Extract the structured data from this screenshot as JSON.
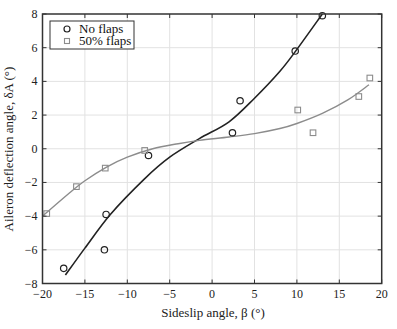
{
  "chart_data": {
    "type": "scatter",
    "title": "",
    "xlabel": "Sideslip angle, β (°)",
    "ylabel": "Aileron deflection angle, δA (°)",
    "xlim": [
      -20,
      20
    ],
    "ylim": [
      -8,
      8
    ],
    "xticks": [
      -20,
      -15,
      -10,
      -5,
      0,
      5,
      10,
      15,
      20
    ],
    "yticks": [
      -8,
      -6,
      -4,
      -2,
      0,
      2,
      4,
      6,
      8
    ],
    "xtick_labels": [
      "−20",
      "−15",
      "−10",
      "−5",
      "0",
      "5",
      "10",
      "15",
      "20"
    ],
    "ytick_labels": [
      "−8",
      "−6",
      "−4",
      "−2",
      "0",
      "2",
      "4",
      "6",
      "8"
    ],
    "grid": true,
    "legend_position": "top-left",
    "series": [
      {
        "name": "No flaps",
        "marker": "circle",
        "color": "#222222",
        "points": [
          [
            -17.5,
            -7.1
          ],
          [
            -12.5,
            -3.9
          ],
          [
            -12.7,
            -6.0
          ],
          [
            -7.5,
            -0.4
          ],
          [
            2.4,
            0.95
          ],
          [
            3.3,
            2.85
          ],
          [
            9.8,
            5.8
          ],
          [
            13.0,
            7.9
          ]
        ],
        "fit_curve": [
          [
            -17.3,
            -7.5
          ],
          [
            -15,
            -5.9
          ],
          [
            -12,
            -3.9
          ],
          [
            -8,
            -1.8
          ],
          [
            -5,
            -0.5
          ],
          [
            -1.5,
            0.6
          ],
          [
            2,
            1.6
          ],
          [
            5,
            3.0
          ],
          [
            8,
            4.6
          ],
          [
            10,
            5.9
          ],
          [
            13,
            8.0
          ]
        ]
      },
      {
        "name": "50% flaps",
        "marker": "square",
        "color": "#8c8c8c",
        "points": [
          [
            -19.5,
            -3.85
          ],
          [
            -16.0,
            -2.25
          ],
          [
            -12.6,
            -1.15
          ],
          [
            -7.95,
            -0.1
          ],
          [
            10.1,
            2.3
          ],
          [
            11.9,
            0.95
          ],
          [
            17.3,
            3.1
          ],
          [
            18.6,
            4.2
          ]
        ],
        "fit_curve": [
          [
            -20,
            -4.0
          ],
          [
            -17,
            -2.7
          ],
          [
            -15,
            -1.9
          ],
          [
            -12.5,
            -1.1
          ],
          [
            -10,
            -0.5
          ],
          [
            -7,
            0.0
          ],
          [
            -4,
            0.3
          ],
          [
            -1.5,
            0.5
          ],
          [
            2,
            0.7
          ],
          [
            5,
            0.9
          ],
          [
            8,
            1.2
          ],
          [
            10,
            1.5
          ],
          [
            13,
            2.1
          ],
          [
            16,
            2.9
          ],
          [
            18.5,
            3.8
          ]
        ]
      }
    ]
  }
}
